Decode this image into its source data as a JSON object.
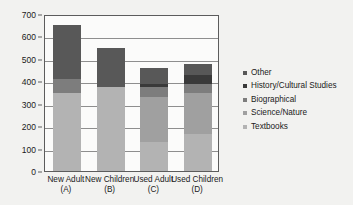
{
  "chart_data": {
    "type": "bar",
    "stacked": true,
    "title": "",
    "xlabel": "",
    "ylabel": "",
    "ylim": [
      0,
      700
    ],
    "yticks": [
      0,
      100,
      200,
      300,
      400,
      500,
      600,
      700
    ],
    "grid": true,
    "legend_position": "right",
    "categories": [
      "New Adult (A)",
      "New Children (B)",
      "Used Adult (C)",
      "Used Children (D)"
    ],
    "category_lines": [
      [
        "New Adult",
        "(A)"
      ],
      [
        "New Children",
        "(B)"
      ],
      [
        "Used Adult",
        "(C)"
      ],
      [
        "Used Children",
        "(D)"
      ]
    ],
    "series": [
      {
        "name": "Textbooks",
        "color": "#b3b3b3",
        "values": [
          350,
          375,
          130,
          165
        ]
      },
      {
        "name": "Science/Nature",
        "color": "#a0a0a0",
        "values": [
          0,
          0,
          200,
          185
        ]
      },
      {
        "name": "Biographical",
        "color": "#7d7d7d",
        "values": [
          60,
          0,
          45,
          40
        ]
      },
      {
        "name": "History/Cultural Studies",
        "color": "#3a3a3a",
        "values": [
          0,
          0,
          15,
          40
        ]
      },
      {
        "name": "Other",
        "color": "#585858",
        "values": [
          240,
          175,
          70,
          45
        ]
      }
    ],
    "totals": [
      650,
      550,
      460,
      475
    ]
  },
  "legend": {
    "entries": [
      {
        "label": "Other",
        "color": "#585858"
      },
      {
        "label": "History/Cultural Studies",
        "color": "#3a3a3a"
      },
      {
        "label": "Biographical",
        "color": "#7d7d7d"
      },
      {
        "label": "Science/Nature",
        "color": "#a0a0a0"
      },
      {
        "label": "Textbooks",
        "color": "#b3b3b3"
      }
    ]
  }
}
